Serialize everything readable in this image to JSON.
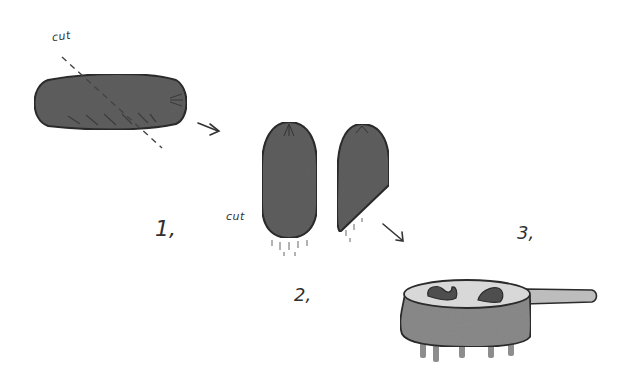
{
  "illustration": {
    "description": "Three-step drawing: a sausage cut diagonally, then two pieces shown, then placed in a pot with a long handle",
    "colors": {
      "background": "#ffffff",
      "sausage_fill": "#5e5e5e",
      "outline": "#2b2b2b",
      "pot_fill": "#8a8a8a",
      "liquid": "#d8d8d8",
      "handle_fill": "#bdbdbd",
      "leg_fill": "#7a7a7a"
    },
    "labels": {
      "cut_top": "cut",
      "cut_side": "cut",
      "step1": "1,",
      "step2": "2,",
      "step3": "3,"
    },
    "steps": [
      {
        "number": "1,",
        "content": "whole sausage with dashed diagonal cut line"
      },
      {
        "number": "2,",
        "content": "sausage halved into two pieces, one with angled cut end"
      },
      {
        "number": "3,",
        "content": "sausage pieces in a pot on a stove"
      }
    ]
  }
}
